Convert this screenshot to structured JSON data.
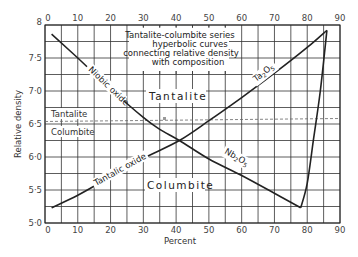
{
  "chart_data": {
    "type": "line",
    "title": "Tantalite-columbite series hyperbolic curves connecting relative density with composition",
    "title_lines": [
      "Tantalite-columbite series",
      "hyperbolic curves",
      "connecting relative density",
      "with composition"
    ],
    "xlabel": "Percent",
    "ylabel": "Relative density",
    "xlim": [
      0,
      90
    ],
    "ylim": [
      5.0,
      8.0
    ],
    "x_ticks": [
      "0",
      "10",
      "20",
      "30",
      "40",
      "50",
      "60",
      "70",
      "80",
      "90"
    ],
    "y_ticks": [
      "5·0",
      "5·5",
      "6·0",
      "6·5",
      "7·0",
      "7·5",
      "8"
    ],
    "grid": true,
    "grid_x_step": 5,
    "grid_y_step": 0.25,
    "series": [
      {
        "name": "Niobic oxide (Nb2O5)",
        "label_upper": "Niobic oxide",
        "label_lower": "Nb2O5",
        "points": [
          [
            2,
            7.86
          ],
          [
            10,
            7.5
          ],
          [
            20,
            7.03
          ],
          [
            30,
            6.6
          ],
          [
            35,
            6.42
          ],
          [
            41,
            6.25
          ],
          [
            50,
            5.97
          ],
          [
            60,
            5.72
          ],
          [
            70,
            5.45
          ],
          [
            78,
            5.23
          ],
          [
            80,
            5.6
          ],
          [
            82,
            6.3
          ],
          [
            84,
            7.0
          ],
          [
            86,
            7.92
          ]
        ]
      },
      {
        "name": "Tantalic oxide (Ta2O5)",
        "label_lower": "Tantalic oxide",
        "label_upper": "Ta2O5",
        "points": [
          [
            2,
            5.23
          ],
          [
            10,
            5.42
          ],
          [
            20,
            5.7
          ],
          [
            30,
            5.98
          ],
          [
            41,
            6.25
          ],
          [
            50,
            6.55
          ],
          [
            60,
            6.9
          ],
          [
            70,
            7.27
          ],
          [
            80,
            7.66
          ],
          [
            86,
            7.92
          ]
        ]
      }
    ],
    "reference_line": {
      "style": "dashed",
      "y_start": 6.55,
      "y_end": 6.6,
      "label_above": "Tantalite",
      "label_below": "Columbite"
    },
    "annotations": [
      {
        "text": "Tantalite",
        "x": 47,
        "y": 6.93
      },
      {
        "text": "Columbite",
        "x": 43,
        "y": 5.52
      },
      {
        "text": "Niobic oxide",
        "x": 17,
        "y": 7.2
      },
      {
        "text": "Nb2O5",
        "x": 60,
        "y": 5.95
      },
      {
        "text": "Tantalic oxide",
        "x": 20,
        "y": 5.9
      },
      {
        "text": "Ta2O5",
        "x": 64,
        "y": 7.4
      }
    ]
  },
  "labels": {
    "title_line1": "Tantalite-columbite series",
    "title_line2": "hyperbolic curves",
    "title_line3": "connecting relative density",
    "title_line4": "with composition",
    "xlabel": "Percent",
    "ylabel": "Relative density",
    "region_tantalite": "Tantalite",
    "region_columbite": "Columbite",
    "ref_tantalite": "Tantalite",
    "ref_columbite": "Columbite",
    "niobic_oxide": "Niobic oxide",
    "tantalic_oxide": "Tantalic oxide",
    "nb_main": "Nb",
    "nb_sub1": "2",
    "nb_o": "O",
    "nb_sub2": "5",
    "ta_main": "Ta",
    "ta_sub1": "2",
    "ta_o": "O",
    "ta_sub2": "5"
  },
  "colors": {
    "curve": "#222222",
    "grid": "#333333",
    "dashed": "#666666",
    "background": "#ffffff"
  }
}
